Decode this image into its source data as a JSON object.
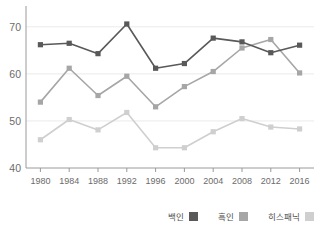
{
  "chart_data": {
    "type": "line",
    "title": "",
    "xlabel": "",
    "ylabel": "",
    "categories": [
      "1980",
      "1984",
      "1988",
      "1992",
      "1996",
      "2000",
      "2004",
      "2008",
      "2012",
      "2016"
    ],
    "ylim": [
      40,
      74
    ],
    "ytick_values": [
      40,
      50,
      60,
      70
    ],
    "ytick_labels": [
      "40",
      "50",
      "60",
      "70"
    ],
    "grid": true,
    "grid_axis": "y",
    "legend_position": "bottom-right",
    "series": [
      {
        "name": "백인",
        "color": "#595959",
        "values": [
          66.2,
          66.5,
          64.3,
          70.6,
          61.2,
          62.2,
          67.6,
          66.8,
          64.5,
          66.1
        ]
      },
      {
        "name": "흑인",
        "color": "#a6a6a6",
        "values": [
          54.0,
          61.2,
          55.4,
          59.5,
          53.0,
          57.3,
          60.5,
          65.5,
          67.3,
          60.2
        ]
      },
      {
        "name": "히스패닉",
        "color": "#cfcfcf",
        "values": [
          46.0,
          50.3,
          48.1,
          51.8,
          44.3,
          44.3,
          47.7,
          50.5,
          48.7,
          48.3
        ]
      }
    ]
  },
  "legend": {
    "items": [
      {
        "label": "백인",
        "color": "#595959"
      },
      {
        "label": "흑인",
        "color": "#a6a6a6"
      },
      {
        "label": "히스패닉",
        "color": "#cfcfcf"
      }
    ]
  },
  "axes": {
    "y_labels": [
      "70",
      "60",
      "50",
      "40"
    ],
    "x_labels": [
      "1980",
      "1984",
      "1988",
      "1992",
      "1996",
      "2000",
      "2004",
      "2008",
      "2012",
      "2016"
    ]
  },
  "colors": {
    "axis_line": "#9a9a9a",
    "grid_line": "#eceaea",
    "tick_text": "#6b6b6b",
    "background": "#ffffff"
  }
}
